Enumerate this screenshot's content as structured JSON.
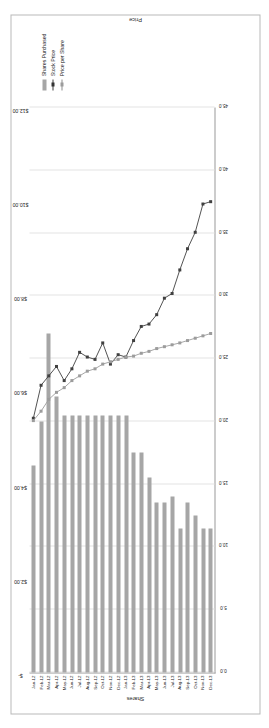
{
  "chart_data": {
    "type": "bar",
    "title": "",
    "xlabel": "",
    "ylabel": "Shares",
    "y2label": "Price",
    "ylim": [
      0,
      45
    ],
    "y2lim": [
      0,
      12
    ],
    "grid": true,
    "legend_position": "right",
    "categories": [
      "Jan-12",
      "Feb-12",
      "Mar-12",
      "Apr-12",
      "May-12",
      "Jun-12",
      "Jul-12",
      "Aug-12",
      "Sep-12",
      "Oct-12",
      "Nov-12",
      "Dec-12",
      "Jan-13",
      "Feb-13",
      "Mar-13",
      "Apr-13",
      "May-13",
      "Jun-13",
      "Jul-13",
      "Aug-13",
      "Sep-13",
      "Oct-13",
      "Nov-13",
      "Dec-13"
    ],
    "y_ticklabels": [
      "45.0",
      "40.0",
      "35.0",
      "30.0",
      "25.0",
      "20.0",
      "15.0",
      "10.0",
      "5.0",
      "0.0"
    ],
    "y_tickvalues": [
      45,
      40,
      35,
      30,
      25,
      20,
      15,
      10,
      5,
      0
    ],
    "y2_ticklabels": [
      "$12.00",
      "$10.00",
      "$8.00",
      "$6.00",
      "$4.00",
      "$2.00",
      "$-"
    ],
    "y2_tickvalues": [
      12,
      10,
      8,
      6,
      4,
      2,
      0
    ],
    "series": [
      {
        "name": "Shares Purchased",
        "axis": "left",
        "kind": "bar",
        "color": "#a6a6a6",
        "values": [
          16.5,
          20.0,
          27.0,
          22.0,
          20.5,
          20.5,
          20.5,
          20.5,
          20.5,
          20.5,
          20.5,
          20.5,
          20.5,
          17.5,
          17.5,
          15.5,
          13.5,
          13.5,
          14.0,
          11.5,
          13.5,
          12.5,
          11.5,
          11.5
        ]
      },
      {
        "name": "Stock Price",
        "axis": "right",
        "kind": "line",
        "color": "#404040",
        "values": [
          5.4,
          6.1,
          6.3,
          6.5,
          6.2,
          6.45,
          6.8,
          6.7,
          6.65,
          7.0,
          6.55,
          6.75,
          6.7,
          7.05,
          7.35,
          7.4,
          7.6,
          7.95,
          8.05,
          8.55,
          9.0,
          9.35,
          9.95,
          10.0
        ]
      },
      {
        "name": "Price per Share",
        "axis": "right",
        "kind": "line",
        "color": "#9c9c9c",
        "values": [
          5.35,
          5.55,
          5.8,
          5.95,
          6.05,
          6.2,
          6.3,
          6.4,
          6.45,
          6.55,
          6.6,
          6.65,
          6.7,
          6.72,
          6.78,
          6.82,
          6.88,
          6.92,
          6.96,
          7.0,
          7.05,
          7.1,
          7.15,
          7.2
        ]
      }
    ],
    "legend": [
      "Shares Purchased",
      "Stock Price",
      "Price per Share"
    ]
  }
}
